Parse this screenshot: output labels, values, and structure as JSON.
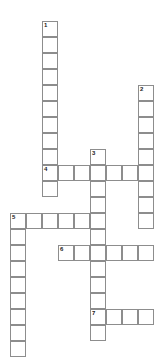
{
  "puzzle": {
    "kind": "crossword-grid",
    "title": "Crossword Puzzle Grid",
    "canvas": {
      "width": 166,
      "height": 356,
      "background": "#ffffff"
    },
    "cell": {
      "size": 16,
      "fill": "#ffffff",
      "border_color": "#8d8d8d",
      "border_width": 1
    },
    "number_style": {
      "color": "#1a1a1a",
      "font_size": 6,
      "bold": true
    },
    "origin": {
      "x": 10,
      "y": 21
    },
    "entries": [
      {
        "number": "1",
        "direction": "down",
        "col": 2,
        "row": 0,
        "length": 10
      },
      {
        "number": "2",
        "direction": "down",
        "col": 8,
        "row": 4,
        "length": 9
      },
      {
        "number": "3",
        "direction": "down",
        "col": 5,
        "row": 8,
        "length": 12
      },
      {
        "number": "4",
        "direction": "across",
        "col": 2,
        "row": 9,
        "length": 7
      },
      {
        "number": "5",
        "direction": "across",
        "col": 0,
        "row": 12,
        "length": 6
      },
      {
        "number": "5",
        "direction": "down",
        "col": 0,
        "row": 12,
        "length": 9
      },
      {
        "number": "6",
        "direction": "across",
        "col": 3,
        "row": 14,
        "length": 6
      },
      {
        "number": "7",
        "direction": "across",
        "col": 5,
        "row": 18,
        "length": 4
      }
    ],
    "cells": [
      {
        "col": 2,
        "row": 0,
        "number": "1"
      },
      {
        "col": 2,
        "row": 1,
        "number": ""
      },
      {
        "col": 2,
        "row": 2,
        "number": ""
      },
      {
        "col": 2,
        "row": 3,
        "number": ""
      },
      {
        "col": 2,
        "row": 4,
        "number": ""
      },
      {
        "col": 2,
        "row": 5,
        "number": ""
      },
      {
        "col": 2,
        "row": 6,
        "number": ""
      },
      {
        "col": 2,
        "row": 7,
        "number": ""
      },
      {
        "col": 2,
        "row": 8,
        "number": ""
      },
      {
        "col": 2,
        "row": 9,
        "number": "4"
      },
      {
        "col": 3,
        "row": 9,
        "number": ""
      },
      {
        "col": 4,
        "row": 9,
        "number": ""
      },
      {
        "col": 5,
        "row": 9,
        "number": ""
      },
      {
        "col": 6,
        "row": 9,
        "number": ""
      },
      {
        "col": 7,
        "row": 9,
        "number": ""
      },
      {
        "col": 8,
        "row": 9,
        "number": ""
      },
      {
        "col": 2,
        "row": 10,
        "number": ""
      },
      {
        "col": 8,
        "row": 4,
        "number": "2"
      },
      {
        "col": 8,
        "row": 5,
        "number": ""
      },
      {
        "col": 8,
        "row": 6,
        "number": ""
      },
      {
        "col": 8,
        "row": 7,
        "number": ""
      },
      {
        "col": 8,
        "row": 8,
        "number": ""
      },
      {
        "col": 8,
        "row": 10,
        "number": ""
      },
      {
        "col": 8,
        "row": 11,
        "number": ""
      },
      {
        "col": 8,
        "row": 12,
        "number": ""
      },
      {
        "col": 5,
        "row": 8,
        "number": "3"
      },
      {
        "col": 5,
        "row": 10,
        "number": ""
      },
      {
        "col": 5,
        "row": 11,
        "number": ""
      },
      {
        "col": 5,
        "row": 12,
        "number": ""
      },
      {
        "col": 5,
        "row": 13,
        "number": ""
      },
      {
        "col": 5,
        "row": 14,
        "number": ""
      },
      {
        "col": 5,
        "row": 15,
        "number": ""
      },
      {
        "col": 5,
        "row": 16,
        "number": ""
      },
      {
        "col": 5,
        "row": 17,
        "number": ""
      },
      {
        "col": 5,
        "row": 19,
        "number": ""
      },
      {
        "col": 0,
        "row": 12,
        "number": "5"
      },
      {
        "col": 1,
        "row": 12,
        "number": ""
      },
      {
        "col": 2,
        "row": 12,
        "number": ""
      },
      {
        "col": 3,
        "row": 12,
        "number": ""
      },
      {
        "col": 4,
        "row": 12,
        "number": ""
      },
      {
        "col": 0,
        "row": 13,
        "number": ""
      },
      {
        "col": 0,
        "row": 14,
        "number": ""
      },
      {
        "col": 0,
        "row": 15,
        "number": ""
      },
      {
        "col": 0,
        "row": 16,
        "number": ""
      },
      {
        "col": 0,
        "row": 17,
        "number": ""
      },
      {
        "col": 0,
        "row": 18,
        "number": ""
      },
      {
        "col": 0,
        "row": 19,
        "number": ""
      },
      {
        "col": 0,
        "row": 20,
        "number": ""
      },
      {
        "col": 3,
        "row": 14,
        "number": "6"
      },
      {
        "col": 4,
        "row": 14,
        "number": ""
      },
      {
        "col": 6,
        "row": 14,
        "number": ""
      },
      {
        "col": 7,
        "row": 14,
        "number": ""
      },
      {
        "col": 8,
        "row": 14,
        "number": ""
      },
      {
        "col": 5,
        "row": 18,
        "number": "7"
      },
      {
        "col": 6,
        "row": 18,
        "number": ""
      },
      {
        "col": 7,
        "row": 18,
        "number": ""
      },
      {
        "col": 8,
        "row": 18,
        "number": ""
      }
    ]
  }
}
